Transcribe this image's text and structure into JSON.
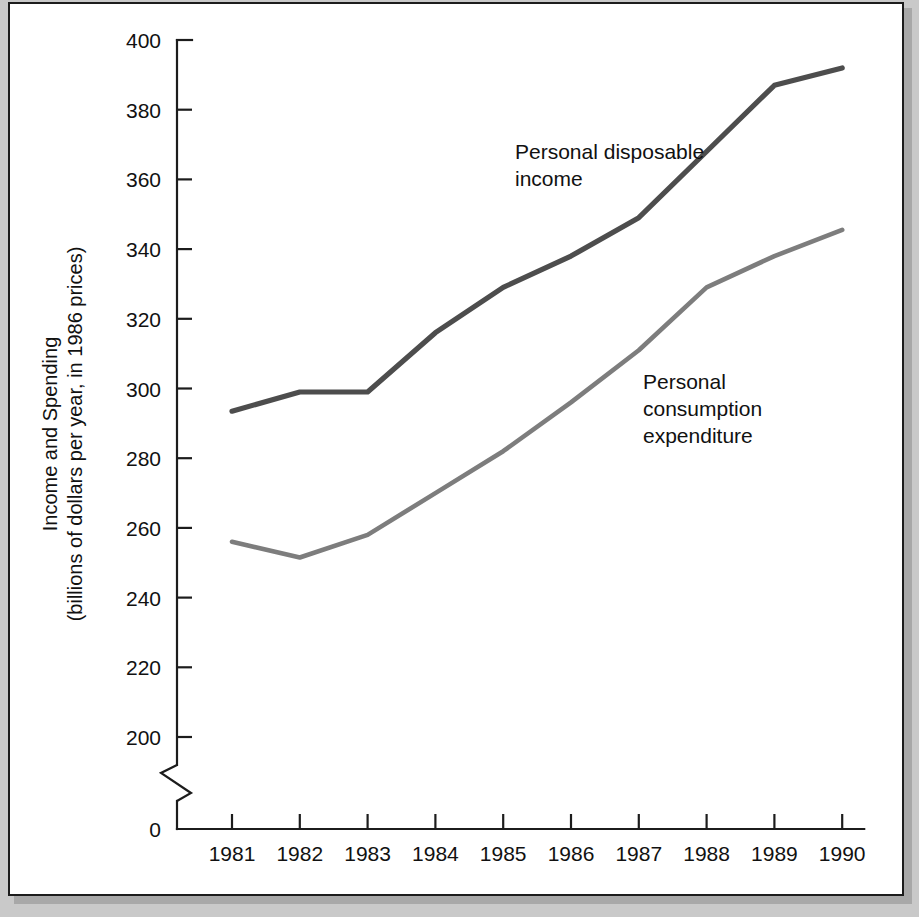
{
  "chart_data": {
    "type": "line",
    "title": "",
    "xlabel": "",
    "ylabel": "Income and Spending",
    "ylabel_line1": "Income and Spending",
    "ylabel_line2": "(billions of dollars per year, in 1986 prices)",
    "categories": [
      "1981",
      "1982",
      "1983",
      "1984",
      "1985",
      "1986",
      "1987",
      "1988",
      "1989",
      "1990"
    ],
    "x": [
      1981,
      1982,
      1983,
      1984,
      1985,
      1986,
      1987,
      1988,
      1989,
      1990
    ],
    "series": [
      {
        "name": "Personal disposable income",
        "color": "#4d4d4d",
        "stroke_width": 5.2,
        "values": [
          293.5,
          299.0,
          299.0,
          316.0,
          329.0,
          338.0,
          349.0,
          368.0,
          387.0,
          392.0
        ]
      },
      {
        "name": "Personal consumption expenditure",
        "color": "#7d7d7d",
        "stroke_width": 4.6,
        "values": [
          256.0,
          251.5,
          258.0,
          270.0,
          282.0,
          296.0,
          311.0,
          329.0,
          338.0,
          345.5
        ]
      }
    ],
    "ylim": [
      200,
      400
    ],
    "ytick_values": [
      200,
      220,
      240,
      260,
      280,
      300,
      320,
      340,
      360,
      380,
      400
    ],
    "ytick_labels": [
      "200",
      "220",
      "240",
      "260",
      "280",
      "300",
      "320",
      "340",
      "360",
      "380",
      "400"
    ],
    "y_zero_label": "0",
    "y_axis_break": true,
    "grid": false,
    "legend_position": "inline-annotations",
    "annotations": [
      {
        "id": "annotation-disposable-income",
        "lines": [
          "Personal disposable",
          "income"
        ],
        "x": 505,
        "y": 155
      },
      {
        "id": "annotation-consumption-expenditure",
        "lines": [
          "Personal",
          "consumption",
          "expenditure"
        ],
        "x": 633,
        "y": 385
      }
    ]
  },
  "figure": {
    "background_color": "#c9c9c9",
    "panel_color": "#ffffff",
    "border_color": "#1c1c1c"
  }
}
